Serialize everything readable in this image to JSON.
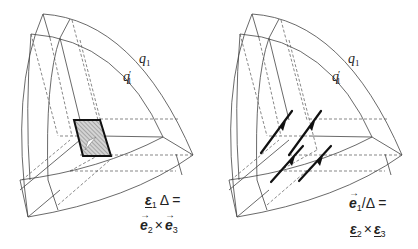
{
  "figure": {
    "panels": [
      {
        "id": "left",
        "surface_labels": {
          "outer": "q",
          "outer_sub": "1",
          "inner": "q",
          "inner_sub": "1",
          "inner_prime": "′"
        },
        "equation": {
          "line1": {
            "sym": "ε",
            "sub": "1",
            "rest": "Δ ="
          },
          "line2": {
            "a": "e",
            "a_sub": "2",
            "op": "×",
            "b": "e",
            "b_sub": "3"
          }
        },
        "element": "hatched-area-element"
      },
      {
        "id": "right",
        "surface_labels": {
          "outer": "q",
          "outer_sub": "1",
          "inner": "q",
          "inner_sub": "1",
          "inner_prime": "′"
        },
        "equation": {
          "line1": {
            "sym": "e",
            "sub": "1",
            "rest": "/Δ ="
          },
          "line2": {
            "a": "ε",
            "a_sub": "2",
            "op": "×",
            "b": "ε",
            "b_sub": "3"
          }
        },
        "element": "line-element-arrows"
      }
    ],
    "colors": {
      "stroke": "#333333",
      "hatch_fill": "#bdbdbd",
      "background": "#ffffff"
    }
  }
}
